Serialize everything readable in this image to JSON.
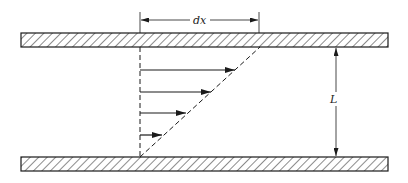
{
  "diagram": {
    "labels": {
      "dx": "dx",
      "L": "L"
    },
    "colors": {
      "stroke": "#1a1a1a",
      "background": "#ffffff"
    },
    "plates": [
      {
        "name": "top-plate",
        "x": 21,
        "y": 33,
        "width": 367,
        "height": 14
      },
      {
        "name": "bottom-plate",
        "x": 21,
        "y": 157,
        "width": 367,
        "height": 14
      }
    ],
    "velocity_arrows": [
      {
        "y": 70,
        "x_end": 236
      },
      {
        "y": 92,
        "x_end": 212
      },
      {
        "y": 113,
        "x_end": 187
      },
      {
        "y": 135,
        "x_end": 162
      }
    ],
    "profile": {
      "baseline_x": 140,
      "top": [
        260,
        47
      ],
      "bottom": [
        140,
        157
      ]
    },
    "dimension_dx": {
      "x1": 140,
      "x2": 259,
      "y": 20
    },
    "dimension_L": {
      "x": 336,
      "y1": 47,
      "y2": 157
    }
  }
}
